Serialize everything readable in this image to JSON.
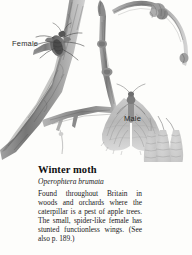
{
  "page": {
    "background_color": "#fdfdfb",
    "ink_color": "#6e6e6e",
    "text_color": "#1a1a1a"
  },
  "illustration": {
    "name": "winter-moth-on-twig-illustration",
    "medium": "pencil-drawing",
    "subjects": [
      "apple-twig-branch",
      "female-winter-moth-on-bark",
      "male-winter-moth-with-wings",
      "hanging-catkins",
      "leaf-buds"
    ],
    "callouts": [
      {
        "id": "female",
        "label": "Female"
      },
      {
        "id": "male",
        "label": "Male"
      }
    ]
  },
  "entry": {
    "title": "Winter moth",
    "scientific_name": "Operophtera brumata",
    "description": "Found throughout Britain in woods and orchards where the caterpillar is a pest of apple trees. The small, spider-like female has stunted functionless wings. (See also p. 189.)"
  }
}
